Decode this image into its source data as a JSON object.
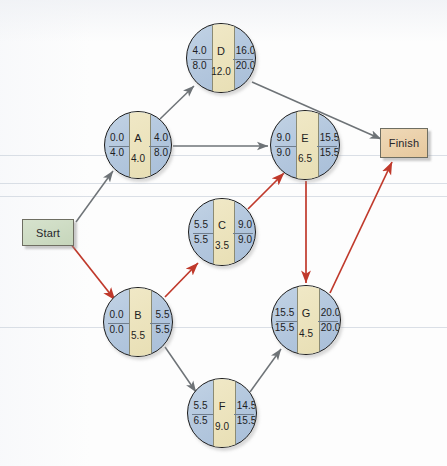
{
  "diagram": {
    "colors": {
      "node_fill": "#b2c6dd",
      "node_center_fill": "#e8dfb5",
      "node_border": "#1b1b1b",
      "critical_arrow": "#c0392b",
      "normal_arrow": "#6e7377",
      "start_fill": "#c6d6bb",
      "finish_fill": "#e6c89d",
      "background": "#fdfdfd"
    },
    "terminals": {
      "start_label": "Start",
      "finish_label": "Finish"
    },
    "legend": {
      "top_left": "ES",
      "top_right": "EF",
      "bottom_left": "LS",
      "bottom_right": "LF",
      "center_top": "Activity",
      "center_bottom": "Duration"
    },
    "nodes": [
      {
        "id": "D",
        "label": "D",
        "es": "4.0",
        "ef": "16.0",
        "ls": "8.0",
        "lf": "20.0",
        "duration": "12.0",
        "cx": 221,
        "cy": 58,
        "r": 35,
        "critical": false
      },
      {
        "id": "A",
        "label": "A",
        "es": "0.0",
        "ef": "4.0",
        "ls": "4.0",
        "lf": "8.0",
        "duration": "4.0",
        "cx": 138,
        "cy": 145,
        "r": 34,
        "critical": false
      },
      {
        "id": "E",
        "label": "E",
        "es": "9.0",
        "ef": "15.5",
        "ls": "9.0",
        "lf": "15.5",
        "duration": "6.5",
        "cx": 305,
        "cy": 145,
        "r": 35,
        "critical": true
      },
      {
        "id": "C",
        "label": "C",
        "es": "5.5",
        "ef": "9.0",
        "ls": "5.5",
        "lf": "9.0",
        "duration": "3.5",
        "cx": 222,
        "cy": 232,
        "r": 34,
        "critical": true
      },
      {
        "id": "B",
        "label": "B",
        "es": "0.0",
        "ef": "5.5",
        "ls": "0.0",
        "lf": "5.5",
        "duration": "5.5",
        "cx": 138,
        "cy": 322,
        "r": 35,
        "critical": true
      },
      {
        "id": "G",
        "label": "G",
        "es": "15.5",
        "ef": "20.0",
        "ls": "15.5",
        "lf": "20.0",
        "duration": "4.5",
        "cx": 306,
        "cy": 320,
        "r": 35,
        "critical": true
      },
      {
        "id": "F",
        "label": "F",
        "es": "5.5",
        "ef": "14.5",
        "ls": "6.5",
        "lf": "15.5",
        "duration": "9.0",
        "cx": 222,
        "cy": 413,
        "r": 35,
        "critical": false
      }
    ],
    "edges": [
      {
        "from": "Start",
        "to": "A",
        "critical": false,
        "x1": 76,
        "y1": 222,
        "x2": 113,
        "y2": 171
      },
      {
        "from": "Start",
        "to": "B",
        "critical": true,
        "x1": 70,
        "y1": 243,
        "x2": 115,
        "y2": 300
      },
      {
        "from": "A",
        "to": "D",
        "critical": false,
        "x1": 160,
        "y1": 119,
        "x2": 194,
        "y2": 86
      },
      {
        "from": "A",
        "to": "E",
        "critical": false,
        "x1": 173,
        "y1": 146,
        "x2": 268,
        "y2": 146
      },
      {
        "from": "D",
        "to": "Finish",
        "critical": false,
        "x1": 252,
        "y1": 82,
        "x2": 381,
        "y2": 139
      },
      {
        "from": "B",
        "to": "C",
        "critical": true,
        "x1": 165,
        "y1": 297,
        "x2": 198,
        "y2": 263
      },
      {
        "from": "B",
        "to": "F",
        "critical": false,
        "x1": 165,
        "y1": 347,
        "x2": 196,
        "y2": 392
      },
      {
        "from": "C",
        "to": "E",
        "critical": true,
        "x1": 248,
        "y1": 209,
        "x2": 284,
        "y2": 173
      },
      {
        "from": "E",
        "to": "G",
        "critical": true,
        "x1": 306,
        "y1": 181,
        "x2": 306,
        "y2": 283
      },
      {
        "from": "F",
        "to": "G",
        "critical": false,
        "x1": 250,
        "y1": 392,
        "x2": 281,
        "y2": 349
      },
      {
        "from": "G",
        "to": "Finish",
        "critical": true,
        "x1": 330,
        "y1": 293,
        "x2": 392,
        "y2": 162
      }
    ],
    "scanlines": [
      155,
      183,
      196,
      327
    ]
  }
}
